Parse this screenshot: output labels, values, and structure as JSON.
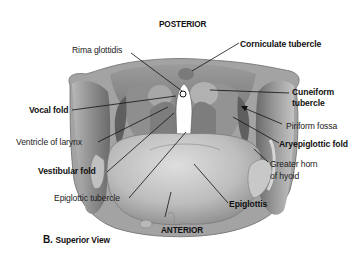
{
  "figure": {
    "orientation_top": "POSTERIOR",
    "orientation_bottom": "ANTERIOR",
    "caption_letter": "B.",
    "caption_text": "Superior View"
  },
  "labels": {
    "rima_glottidis": "Rima glottidis",
    "corniculate_tubercle": "Corniculate tubercle",
    "vocal_fold": "Vocal fold",
    "cuneiform_tubercle_line1": "Cuneiform",
    "cuneiform_tubercle_line2": "tubercle",
    "ventricle_of_larynx": "Ventricle of larynx",
    "piriform_fossa": "Piriform fossa",
    "vestibular_fold": "Vestibular fold",
    "aryepiglottic_fold": "Aryepiglottic fold",
    "greater_horn_line1": "Greater horn",
    "greater_horn_line2": "of hyoid",
    "epiglottic_tubercle": "Epiglottic tubercle",
    "epiglottis": "Epiglottis"
  },
  "colors": {
    "tissue_dark": "#6e6e6e",
    "tissue_mid": "#a9a9a9",
    "tissue_light": "#d4d4d4",
    "leader_line": "#111111",
    "glottis_opening": "#ffffff"
  }
}
